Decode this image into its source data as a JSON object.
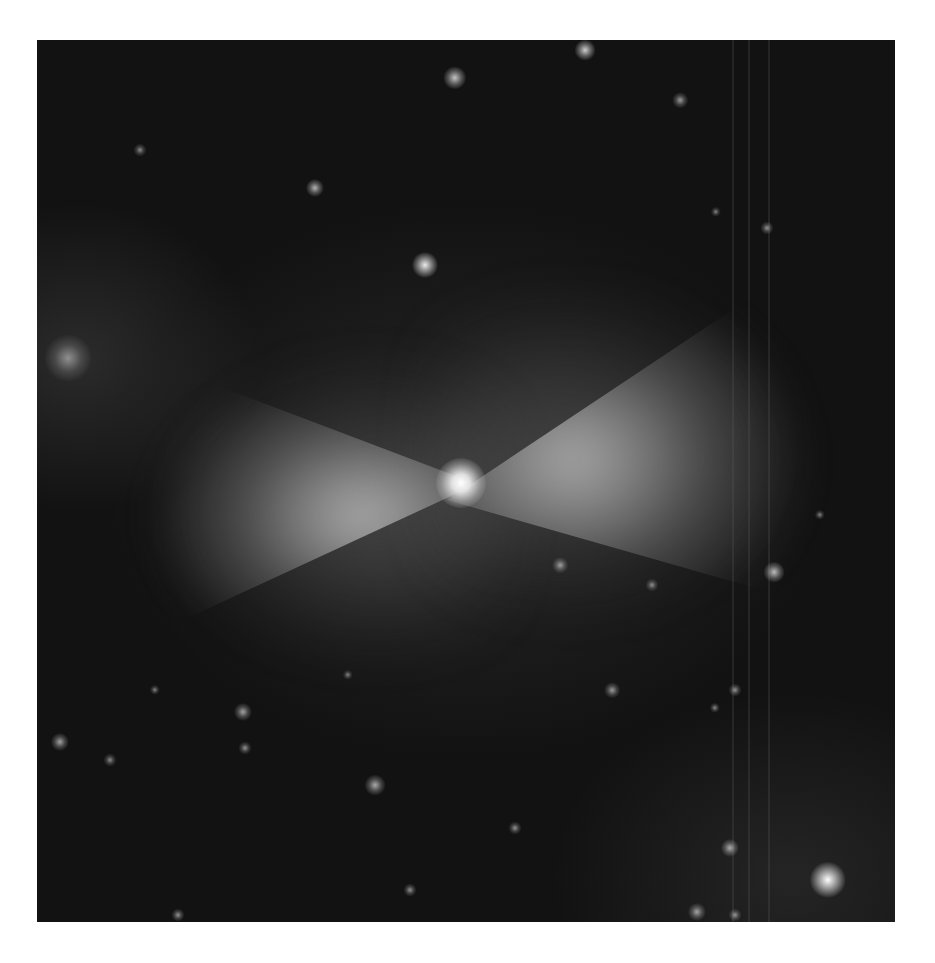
{
  "image": {
    "subject": "bipolar nebula",
    "colormap": "grayscale",
    "background_color": "#ffffff",
    "frame": {
      "x": 37,
      "y": 40,
      "width": 858,
      "height": 882
    },
    "core": {
      "x": 461,
      "y": 483
    },
    "stars": [
      {
        "x": 585,
        "y": 50,
        "r": 8,
        "b": 0.75
      },
      {
        "x": 455,
        "y": 78,
        "r": 9,
        "b": 0.7
      },
      {
        "x": 680,
        "y": 100,
        "r": 6,
        "b": 0.45
      },
      {
        "x": 140,
        "y": 150,
        "r": 5,
        "b": 0.35
      },
      {
        "x": 315,
        "y": 188,
        "r": 7,
        "b": 0.6
      },
      {
        "x": 767,
        "y": 228,
        "r": 5,
        "b": 0.4
      },
      {
        "x": 716,
        "y": 212,
        "r": 4,
        "b": 0.3
      },
      {
        "x": 425,
        "y": 265,
        "r": 10,
        "b": 0.9
      },
      {
        "x": 68,
        "y": 358,
        "r": 18,
        "b": 0.35
      },
      {
        "x": 560,
        "y": 565,
        "r": 6,
        "b": 0.45
      },
      {
        "x": 774,
        "y": 572,
        "r": 8,
        "b": 0.65
      },
      {
        "x": 652,
        "y": 585,
        "r": 5,
        "b": 0.35
      },
      {
        "x": 820,
        "y": 515,
        "r": 4,
        "b": 0.3
      },
      {
        "x": 612,
        "y": 690,
        "r": 6,
        "b": 0.45
      },
      {
        "x": 735,
        "y": 690,
        "r": 5,
        "b": 0.4
      },
      {
        "x": 715,
        "y": 708,
        "r": 4,
        "b": 0.35
      },
      {
        "x": 243,
        "y": 712,
        "r": 7,
        "b": 0.5
      },
      {
        "x": 60,
        "y": 742,
        "r": 7,
        "b": 0.5
      },
      {
        "x": 245,
        "y": 748,
        "r": 5,
        "b": 0.4
      },
      {
        "x": 110,
        "y": 760,
        "r": 5,
        "b": 0.35
      },
      {
        "x": 375,
        "y": 785,
        "r": 8,
        "b": 0.55
      },
      {
        "x": 515,
        "y": 828,
        "r": 5,
        "b": 0.4
      },
      {
        "x": 730,
        "y": 848,
        "r": 7,
        "b": 0.55
      },
      {
        "x": 828,
        "y": 880,
        "r": 14,
        "b": 1.0
      },
      {
        "x": 410,
        "y": 890,
        "r": 5,
        "b": 0.4
      },
      {
        "x": 697,
        "y": 912,
        "r": 7,
        "b": 0.5
      },
      {
        "x": 178,
        "y": 915,
        "r": 5,
        "b": 0.4
      },
      {
        "x": 735,
        "y": 915,
        "r": 5,
        "b": 0.4
      },
      {
        "x": 155,
        "y": 690,
        "r": 4,
        "b": 0.3
      },
      {
        "x": 348,
        "y": 675,
        "r": 4,
        "b": 0.3
      }
    ],
    "detector_stripes_x": [
      732,
      748,
      768
    ]
  }
}
